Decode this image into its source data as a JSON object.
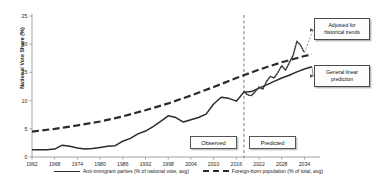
{
  "chart_data": {
    "type": "line",
    "title": "",
    "xlabel": "",
    "ylabel": "National Vote Share (%)",
    "ylim": [
      0,
      25
    ],
    "yticks": [
      0,
      5,
      10,
      15,
      20,
      25
    ],
    "xlim": [
      1962,
      2036
    ],
    "xticks": [
      1962,
      1968,
      1974,
      1980,
      1986,
      1992,
      1998,
      2004,
      2010,
      2016,
      2022,
      2028,
      2034
    ],
    "grid": false,
    "legend_position": "bottom",
    "divider_year": 2018,
    "series": [
      {
        "name": "Anti-immigrant parties (% of national vote, avg)",
        "style": "solid",
        "color": "#2b2b2b",
        "x": [
          1962,
          1964,
          1966,
          1968,
          1970,
          1972,
          1974,
          1976,
          1978,
          1980,
          1982,
          1984,
          1986,
          1988,
          1990,
          1992,
          1994,
          1996,
          1998,
          2000,
          2002,
          2004,
          2006,
          2008,
          2010,
          2012,
          2014,
          2016,
          2018,
          2020,
          2022,
          2024,
          2026,
          2028,
          2030,
          2032,
          2034,
          2036
        ],
        "y": [
          1.3,
          1.3,
          1.3,
          1.4,
          2.1,
          1.9,
          1.6,
          1.4,
          1.5,
          1.7,
          1.9,
          2.0,
          2.8,
          3.3,
          4.1,
          4.6,
          5.4,
          6.3,
          7.3,
          7.0,
          6.2,
          6.6,
          7.0,
          7.6,
          9.4,
          10.6,
          10.4,
          9.9,
          11.5,
          11.6,
          12.2,
          12.8,
          13.4,
          14.0,
          14.5,
          15.1,
          15.6,
          16.0
        ]
      },
      {
        "name": "Foreign-born population (% of total, avg)",
        "style": "dashed",
        "color": "#2b2b2b",
        "x": [
          1962,
          1968,
          1974,
          1980,
          1986,
          1992,
          1998,
          2004,
          2010,
          2016,
          2022,
          2028,
          2034,
          2036
        ],
        "y": [
          4.5,
          5.0,
          5.6,
          6.3,
          7.2,
          8.3,
          9.5,
          10.9,
          12.4,
          14.0,
          15.5,
          16.8,
          17.9,
          18.2
        ]
      },
      {
        "name": "Adjusted for historical trends",
        "style": "dotted",
        "color": "#3a3a3a",
        "x": [
          2018,
          2019,
          2020,
          2021,
          2022,
          2023,
          2024,
          2025,
          2026,
          2027,
          2028,
          2029,
          2030,
          2031,
          2032,
          2033,
          2034
        ],
        "y": [
          11.6,
          11.0,
          10.9,
          11.6,
          12.4,
          12.0,
          13.4,
          14.3,
          14.0,
          15.0,
          16.2,
          15.4,
          16.7,
          18.0,
          20.5,
          19.8,
          18.5
        ]
      }
    ],
    "annotations": [
      {
        "name": "adjusted-callout",
        "label": "Adjusted for\nhistorical trends",
        "line1": "Adjusted for",
        "line2": "historical trends"
      },
      {
        "name": "linear-callout",
        "label": "General linear\nprediction",
        "line1": "General linear",
        "line2": "prediction"
      },
      {
        "name": "observed-band",
        "label": "Observed"
      },
      {
        "name": "predicted-band",
        "label": "Predicted"
      }
    ]
  },
  "labels": {
    "y_axis_title": "National Vote Share (%)",
    "observed": "Observed",
    "predicted": "Predicted",
    "callout_adjusted_line1": "Adjusted for",
    "callout_adjusted_line2": "historical trends",
    "callout_linear_line1": "General linear",
    "callout_linear_line2": "prediction",
    "legend_solid": "Anti-immigrant parties (% of national vote, avg)",
    "legend_dashed": "Foreign-born population (% of total, avg)"
  },
  "colors": {
    "line": "#2b2b2b",
    "axis": "#9a9a9a",
    "divider": "#9aa0a6",
    "text": "#1a1a1a"
  }
}
